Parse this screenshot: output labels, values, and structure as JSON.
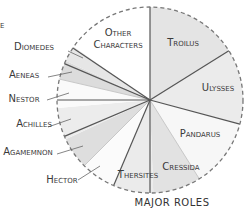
{
  "chart_data": {
    "type": "pie",
    "title": "MAJOR ROLES",
    "center": [
      150,
      100
    ],
    "radius": 93,
    "start_angle_deg": 0,
    "direction": "clockwise",
    "slices": [
      {
        "name": "Troilus",
        "start": 0,
        "end": 58,
        "fill": "#e4e4e4",
        "label_inside": true,
        "label_pos": [
          183,
          46
        ]
      },
      {
        "name": "Ulysses",
        "start": 58,
        "end": 105,
        "fill": "#ebebeb",
        "label_inside": true,
        "label_pos": [
          218,
          91
        ]
      },
      {
        "name": "Pandarus",
        "start": 105,
        "end": 148,
        "fill": "#f7f7f7",
        "label_inside": true,
        "label_pos": [
          200,
          137
        ]
      },
      {
        "name": "Cressida",
        "start": 148,
        "end": 178,
        "fill": "#e2e2e2",
        "label_inside": true,
        "label_pos": [
          181,
          170
        ]
      },
      {
        "name": "Thersites",
        "start": 178,
        "end": 203,
        "fill": "#ebebeb",
        "label_inside": true,
        "label_pos": [
          138,
          178
        ]
      },
      {
        "name": "Hector",
        "start": 203,
        "end": 225,
        "fill": "#fbfbfb",
        "label_inside": false,
        "label_pos": [
          62,
          183
        ],
        "leader": [
          [
            78,
            180
          ],
          [
            100,
            166
          ]
        ]
      },
      {
        "name": "Agamemnon",
        "start": 225,
        "end": 245,
        "fill": "#dedede",
        "label_inside": false,
        "label_pos": [
          28,
          155
        ],
        "leader": [
          [
            57,
            154
          ],
          [
            83,
            146
          ]
        ]
      },
      {
        "name": "Achilles",
        "start": 245,
        "end": 265,
        "fill": "#ececec",
        "label_inside": false,
        "label_pos": [
          34,
          127
        ],
        "leader": [
          [
            48,
            127
          ],
          [
            71,
            119
          ]
        ]
      },
      {
        "name": "Nestor",
        "start": 265,
        "end": 283,
        "fill": "#fafafa",
        "label_inside": false,
        "label_pos": [
          24,
          102
        ],
        "leader": [
          [
            47,
            100
          ],
          [
            69,
            93
          ]
        ]
      },
      {
        "name": "Aeneas",
        "start": 283,
        "end": 295,
        "fill": "#dcdcdc",
        "label_inside": false,
        "label_pos": [
          24,
          78
        ],
        "leader": [
          [
            48,
            77
          ],
          [
            72,
            72
          ]
        ]
      },
      {
        "name": "Diomedes",
        "start": 295,
        "end": 305,
        "fill": "#e6e6e6",
        "label_inside": false,
        "label_pos": [
          34,
          50
        ],
        "leader": [
          [
            68,
            51
          ],
          [
            83,
            58
          ]
        ]
      },
      {
        "name": "Other Characters",
        "start": 305,
        "end": 360,
        "fill": "#ffffff",
        "label_inside": true,
        "label_pos": [
          118,
          36
        ],
        "label_lines": [
          "Other",
          "Characters"
        ],
        "dashed_edge": true
      }
    ],
    "dark_dividers_deg": [
      0,
      58,
      105,
      180,
      203,
      247,
      270,
      293,
      304
    ],
    "light_dividers_deg": [
      148,
      225,
      283
    ],
    "outline": "dashed",
    "xlabel": "",
    "ylabel": ""
  },
  "texts": {
    "title": "Major Roles",
    "corner_fragment": "e"
  }
}
